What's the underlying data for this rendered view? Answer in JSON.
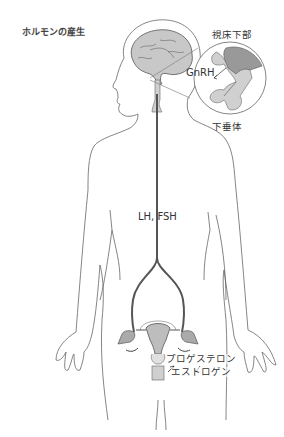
{
  "title": "ホルモンの産生",
  "labels": {
    "hypothalamus": "視床下部",
    "gnrh": "GnRH",
    "pituitary": "下垂体",
    "lh_fsh": "LH, FSH",
    "progesterone": "プロゲステロン",
    "estrogen": "エストロゲン"
  },
  "colors": {
    "outline": "#555555",
    "brain_fill": "#c8c8c8",
    "hypothalamus_fill": "#999999",
    "pituitary_fill": "#d0d0d0",
    "pathway": "#555555",
    "uterus_fill": "#bdbdbd"
  }
}
